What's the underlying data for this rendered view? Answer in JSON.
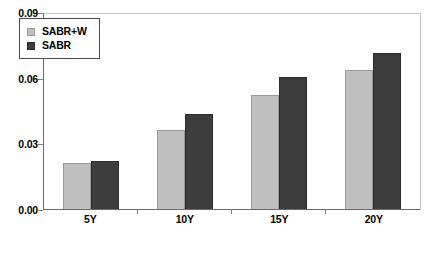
{
  "chart_data": {
    "type": "bar",
    "title": "",
    "xlabel": "",
    "ylabel": "",
    "categories": [
      "5Y",
      "10Y",
      "15Y",
      "20Y"
    ],
    "series": [
      {
        "name": "SABR+W",
        "color": "#c0c0c0",
        "values": [
          0.021,
          0.036,
          0.052,
          0.0635
        ]
      },
      {
        "name": "SABR",
        "color": "#3d3d3d",
        "values": [
          0.022,
          0.0435,
          0.0605,
          0.0715
        ]
      }
    ],
    "ylim": [
      0.0,
      0.09
    ],
    "yticks": [
      0.0,
      0.03,
      0.06,
      0.09
    ],
    "ytick_labels": [
      "0.00",
      "0.03",
      "0.06",
      "0.09"
    ],
    "grid": false,
    "legend_position": "top-left-inside"
  },
  "legend": {
    "items": [
      {
        "label": "SABR+W"
      },
      {
        "label": "SABR"
      }
    ]
  }
}
